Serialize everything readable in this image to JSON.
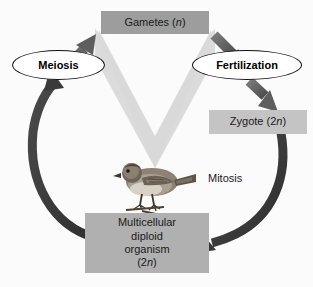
{
  "figure": {
    "type": "cycle-diagram",
    "background_color": "#fbfbfb",
    "organism_depicted": "bird"
  },
  "nodes": {
    "gametes": {
      "label": "Gametes (n)",
      "text": "Gametes (",
      "ploidy": "n",
      "ploidy_suffix": ")",
      "shape": "rectangle",
      "fill": "#9d9d9d"
    },
    "zygote": {
      "label": "Zygote (2n)",
      "text": "Zygote (2",
      "ploidy": "n",
      "ploidy_suffix": ")",
      "shape": "rectangle",
      "fill": "#c4c4c4"
    },
    "organism": {
      "label": "Multicellular diploid organism (2n)",
      "line1": "Multicellular",
      "line2": "diploid",
      "line3": "organism",
      "line4_prefix": "(2",
      "ploidy": "n",
      "line4_suffix": ")",
      "shape": "rectangle",
      "fill": "#b0b0b0"
    },
    "meiosis": {
      "label": "Meiosis",
      "shape": "ellipse",
      "fill": "#ffffff",
      "stroke": "#111111"
    },
    "fertilization": {
      "label": "Fertilization",
      "shape": "ellipse",
      "fill": "#ffffff",
      "stroke": "#111111"
    }
  },
  "edge_labels": {
    "mitosis": "Mitosis"
  },
  "arrows": [
    {
      "name": "organism-to-meiosis",
      "from": "organism",
      "to": "meiosis",
      "style": "thick-arc",
      "color": "#3a3a3a"
    },
    {
      "name": "meiosis-to-gametes",
      "from": "meiosis",
      "to": "gametes",
      "style": "straight-diagonal",
      "color": "#5e5e5e"
    },
    {
      "name": "gametes-to-fertilization",
      "from": "gametes",
      "to": "fertilization",
      "style": "straight-diagonal",
      "color": "#5e5e5e"
    },
    {
      "name": "fertilization-to-zygote",
      "from": "fertilization",
      "to": "zygote",
      "style": "straight-diagonal",
      "color": "#5e5e5e"
    },
    {
      "name": "zygote-to-organism",
      "from": "zygote",
      "to": "organism",
      "style": "thick-arc",
      "color": "#3a3a3a",
      "label": "Mitosis"
    }
  ],
  "decoration": {
    "chevron_name": "background-chevron",
    "chevron_color": "#dcdcdc"
  }
}
